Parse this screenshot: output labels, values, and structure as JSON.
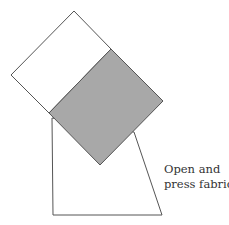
{
  "diagram": {
    "caption_lines": [
      "Open and",
      "press fabric."
    ],
    "colors": {
      "stroke": "#555555",
      "shaded_fill": "#a8a8a8",
      "background": "#ffffff"
    },
    "shapes": {
      "background_piece": "trapezoid",
      "white_square": "rotated square (unshaded)",
      "shaded_square": "rotated square (gray, pressed fabric)"
    }
  }
}
